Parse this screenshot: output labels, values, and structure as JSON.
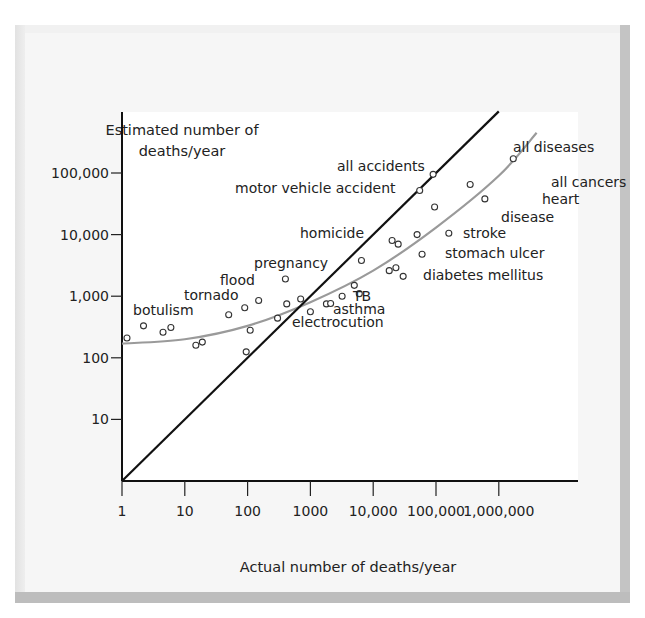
{
  "chart_data": {
    "type": "scatter",
    "title": "",
    "xlabel": "Actual number of deaths/year",
    "ylabel": "Estimated number of deaths/year",
    "ylabel_lines": [
      "Estimated number of",
      "deaths/year"
    ],
    "x_scale": "log",
    "y_scale": "log",
    "xlim": [
      1,
      5000000
    ],
    "ylim": [
      1,
      1000000
    ],
    "x_ticks": [
      {
        "value": 1,
        "label": "1"
      },
      {
        "value": 10,
        "label": "10"
      },
      {
        "value": 100,
        "label": "100"
      },
      {
        "value": 1000,
        "label": "1000"
      },
      {
        "value": 10000,
        "label": "10,000"
      },
      {
        "value": 100000,
        "label": "100,000"
      },
      {
        "value": 1000000,
        "label": "1,000,000"
      }
    ],
    "y_ticks": [
      {
        "value": 10,
        "label": "10"
      },
      {
        "value": 100,
        "label": "100"
      },
      {
        "value": 1000,
        "label": "1,000"
      },
      {
        "value": 10000,
        "label": "10,000"
      },
      {
        "value": 100000,
        "label": "100,000"
      }
    ],
    "grid": false,
    "reference_line": {
      "name": "perfect estimate (y = x)",
      "from": [
        1,
        1
      ],
      "to": [
        1000000,
        1000000
      ],
      "color": "#111111"
    },
    "fit_curve": {
      "name": "best-fit curve",
      "color": "#9a9a9a",
      "points": [
        [
          1,
          170
        ],
        [
          10,
          200
        ],
        [
          100,
          330
        ],
        [
          1000,
          800
        ],
        [
          10000,
          2600
        ],
        [
          100000,
          13000
        ],
        [
          1000000,
          90000
        ],
        [
          4000000,
          450000
        ]
      ]
    },
    "series": [
      {
        "name": "hazards",
        "marker": "open-circle",
        "points": [
          {
            "x": 1.2,
            "y": 210
          },
          {
            "x": 2.2,
            "y": 330,
            "label": "botulism"
          },
          {
            "x": 4.5,
            "y": 260
          },
          {
            "x": 6,
            "y": 310
          },
          {
            "x": 15,
            "y": 160
          },
          {
            "x": 19,
            "y": 180
          },
          {
            "x": 50,
            "y": 500,
            "label": "tornado"
          },
          {
            "x": 90,
            "y": 650,
            "label": "flood"
          },
          {
            "x": 95,
            "y": 125
          },
          {
            "x": 110,
            "y": 280
          },
          {
            "x": 150,
            "y": 850
          },
          {
            "x": 300,
            "y": 440
          },
          {
            "x": 400,
            "y": 1900,
            "label": "pregnancy"
          },
          {
            "x": 420,
            "y": 750
          },
          {
            "x": 700,
            "y": 900
          },
          {
            "x": 1000,
            "y": 560,
            "label": "electrocution"
          },
          {
            "x": 1800,
            "y": 750
          },
          {
            "x": 2100,
            "y": 760,
            "label": "asthma"
          },
          {
            "x": 3200,
            "y": 1000,
            "label": "TB"
          },
          {
            "x": 5000,
            "y": 1500
          },
          {
            "x": 6000,
            "y": 1100
          },
          {
            "x": 6500,
            "y": 3800
          },
          {
            "x": 18000,
            "y": 2600
          },
          {
            "x": 20000,
            "y": 8000,
            "label": "homicide"
          },
          {
            "x": 23000,
            "y": 2900
          },
          {
            "x": 25000,
            "y": 7000
          },
          {
            "x": 30000,
            "y": 2100,
            "label": "diabetes mellitus"
          },
          {
            "x": 50000,
            "y": 10000
          },
          {
            "x": 55000,
            "y": 52000,
            "label": "motor vehicle accident"
          },
          {
            "x": 60000,
            "y": 4800,
            "label": "stomach ulcer"
          },
          {
            "x": 90000,
            "y": 95000,
            "label": "all accidents"
          },
          {
            "x": 95000,
            "y": 28000
          },
          {
            "x": 160000,
            "y": 10500,
            "label": "stroke"
          },
          {
            "x": 350000,
            "y": 65000,
            "label": "all cancers"
          },
          {
            "x": 600000,
            "y": 38000,
            "label": "heart disease"
          },
          {
            "x": 1700000,
            "y": 170000,
            "label": "all diseases"
          }
        ]
      }
    ],
    "annotations": [
      {
        "text": "all diseases",
        "px": 513,
        "py": 152
      },
      {
        "text": "all accidents",
        "px": 337,
        "py": 171
      },
      {
        "text": "motor vehicle accident",
        "px": 235,
        "py": 193
      },
      {
        "text": "all cancers",
        "px": 551,
        "py": 187,
        "anchor": "middle"
      },
      {
        "text": "heart",
        "px": 542,
        "py": 204
      },
      {
        "text": "disease",
        "px": 501,
        "py": 222
      },
      {
        "text": "homicide",
        "px": 300,
        "py": 238
      },
      {
        "text": "stroke",
        "px": 463,
        "py": 238
      },
      {
        "text": "stomach ulcer",
        "px": 445,
        "py": 258
      },
      {
        "text": "pregnancy",
        "px": 254,
        "py": 268
      },
      {
        "text": "flood",
        "px": 220,
        "py": 285
      },
      {
        "text": "diabetes mellitus",
        "px": 423,
        "py": 280
      },
      {
        "text": "tornado",
        "px": 184,
        "py": 300
      },
      {
        "text": "TB",
        "px": 353,
        "py": 301
      },
      {
        "text": "botulism",
        "px": 133,
        "py": 315
      },
      {
        "text": "asthma",
        "px": 333,
        "py": 314
      },
      {
        "text": "electrocution",
        "px": 292,
        "py": 327
      }
    ],
    "axis_geometry": {
      "origin_px": [
        122,
        481
      ],
      "x_decade_px": 62.8,
      "y_decade_px": 61.6,
      "x_axis_end_px": 578,
      "y_axis_top_px": 112
    }
  }
}
